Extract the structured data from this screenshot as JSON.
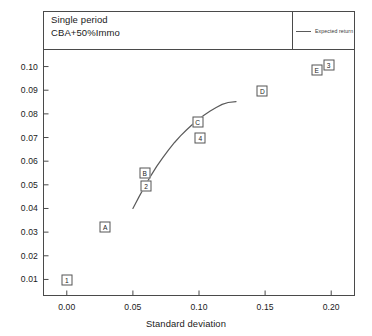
{
  "header": {
    "title_lines": [
      "Single period",
      "CBA+50%Immo"
    ]
  },
  "legend": {
    "items": [
      {
        "label": "Expected return",
        "marker": "line",
        "color": "#5a5a5a"
      }
    ]
  },
  "chart_data": {
    "type": "scatter",
    "title": "Single period CBA+50%Immo",
    "xlabel": "Standard deviation",
    "ylabel": "",
    "xlim": [
      -0.018,
      0.218
    ],
    "ylim": [
      0.003,
      0.107
    ],
    "grid": false,
    "legend_position": "top-right",
    "xticks": [
      0.0,
      0.05,
      0.1,
      0.15,
      0.2
    ],
    "xticklabels": [
      "0.00",
      "0.05",
      "0.10",
      "0.15",
      "0.20"
    ],
    "yticks": [
      0.01,
      0.02,
      0.03,
      0.04,
      0.05,
      0.06,
      0.07,
      0.08,
      0.09,
      0.1
    ],
    "yticklabels": [
      "0.01",
      "0.02",
      "0.03",
      "0.04",
      "0.05",
      "0.06",
      "0.07",
      "0.08",
      "0.09",
      "0.10"
    ],
    "points": [
      {
        "label": "1",
        "x": 0.0,
        "y": 0.0098
      },
      {
        "label": "A",
        "x": 0.029,
        "y": 0.0322
      },
      {
        "label": "2",
        "x": 0.06,
        "y": 0.0495
      },
      {
        "label": "B",
        "x": 0.059,
        "y": 0.0548
      },
      {
        "label": "4",
        "x": 0.101,
        "y": 0.0698
      },
      {
        "label": "C",
        "x": 0.099,
        "y": 0.0765
      },
      {
        "label": "D",
        "x": 0.148,
        "y": 0.0898
      },
      {
        "label": "E",
        "x": 0.189,
        "y": 0.0985
      },
      {
        "label": "3",
        "x": 0.198,
        "y": 0.1005
      }
    ],
    "series": [
      {
        "name": "Expected return",
        "type": "line",
        "color": "#5a5a5a",
        "x": [
          0.05,
          0.0545,
          0.059,
          0.0635,
          0.068,
          0.0725,
          0.077,
          0.0815,
          0.086,
          0.0905,
          0.095,
          0.0995,
          0.104,
          0.1085,
          0.113,
          0.1175,
          0.122,
          0.128
        ],
        "y": [
          0.04,
          0.0448,
          0.0494,
          0.0538,
          0.0578,
          0.0614,
          0.0648,
          0.0679,
          0.0707,
          0.0732,
          0.0755,
          0.0776,
          0.0795,
          0.0812,
          0.0827,
          0.084,
          0.0848,
          0.0852
        ]
      }
    ]
  },
  "axis": {
    "xlabel": "Standard deviation"
  }
}
